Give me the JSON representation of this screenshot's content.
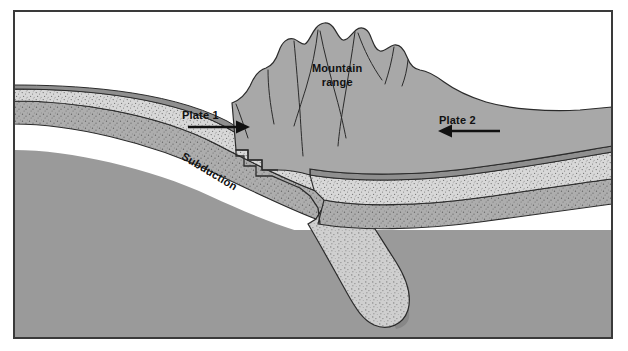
{
  "figure": {
    "kind": "geological-cross-section",
    "frame": {
      "x": 14,
      "y": 11,
      "width": 598,
      "height": 327,
      "border_color": "#3a3a3a",
      "sky_color": "#ffffff"
    }
  },
  "labels": {
    "mountain_range_line1": "Mountain",
    "mountain_range_line2": "range",
    "plate1": "Plate 1",
    "plate2": "Plate 2",
    "subduction": "Subduction"
  },
  "arrows": {
    "plate1": {
      "direction": "right",
      "from_x": 188,
      "to_x": 240,
      "y": 127
    },
    "plate2": {
      "direction": "left",
      "from_x": 500,
      "to_x": 441,
      "y": 131
    }
  },
  "colors": {
    "sky": "#ffffff",
    "mantle": "#9a9a9a",
    "mantle_deep": "#909090",
    "lower_crust": "#adadad",
    "upper_crust_stipple": "#d8d8d8",
    "sediment_band": "#c4c4c4",
    "mountain_fill": "#a8a8a8",
    "slab_fill": "#cfcfcf",
    "slab_shadow": "#878787",
    "outline": "#2b2b2b",
    "text": "#111111"
  },
  "layers": [
    {
      "name": "sky",
      "description": "white air above ground surface"
    },
    {
      "name": "thin-surface-line",
      "description": "dark thin topmost crust line at the ground surface"
    },
    {
      "name": "upper-crust",
      "description": "light stippled upper crust layer"
    },
    {
      "name": "lower-crust",
      "description": "mid-grey stippled lower crust layer"
    },
    {
      "name": "mantle",
      "description": "uniform grey mantle filling the lower half"
    }
  ],
  "features": {
    "mountain_range": {
      "description": "jagged uplifted peaks at collision zone",
      "peak_count": 7
    },
    "subducting_slab": {
      "description": "stippled slab descending left-to-right to a rounded tip",
      "tip_x": 392,
      "tip_y": 327
    },
    "collision_fault": {
      "description": "stair-stepped fault contact at plate suture",
      "x": 300
    }
  }
}
